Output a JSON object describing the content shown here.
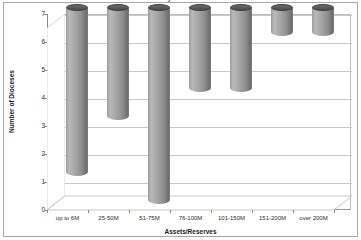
{
  "chart_data": {
    "type": "bar",
    "title": "Dioceses by Assets/Reserves",
    "xlabel": "Assets/Reserves",
    "ylabel": "Number of Dioceses",
    "categories": [
      "up to 6M",
      "25-50M",
      "51-75M",
      "76-100M",
      "101-150M",
      "151-200M",
      "over 200M"
    ],
    "values": [
      6,
      4,
      7,
      3,
      3,
      1,
      1
    ],
    "ylim": [
      0,
      7
    ],
    "yticks": [
      "0",
      "1",
      "2",
      "3",
      "4",
      "5",
      "6",
      "7"
    ],
    "grid": true,
    "legend": "none",
    "style": "3d-cylinder",
    "series": [
      {
        "name": "Number of Dioceses",
        "values": [
          6,
          4,
          7,
          3,
          3,
          1,
          1
        ]
      }
    ],
    "colors": {
      "bar_light": "#b9b9b9",
      "bar_mid": "#a6a6a6",
      "bar_dark": "#6f6f6f",
      "bar_top": "#4c4c4c",
      "gridline": "#c9c9c9",
      "axis": "#8a8a8a",
      "background": "#ffffff",
      "frame": "#a8a8a8",
      "text": "#1a1a1a"
    }
  }
}
